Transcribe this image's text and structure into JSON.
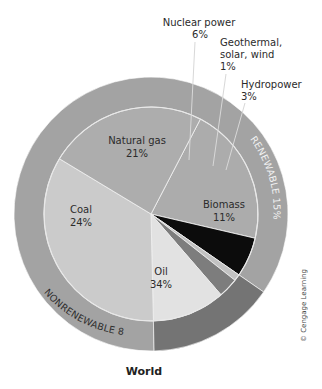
{
  "chart_data": {
    "type": "pie",
    "title": "World",
    "subtitle": "",
    "inner_ring": {
      "categories": [
        "Natural gas",
        "Nuclear power",
        "Geothermal, solar, wind",
        "Hydropower",
        "Biomass",
        "Oil",
        "Coal"
      ],
      "values": [
        21,
        6,
        1,
        3,
        11,
        34,
        24
      ],
      "unit": "%",
      "colors": [
        "#acacac",
        "#0c0c0c",
        "#c2c2c2",
        "#7d7d7d",
        "#e2e2e2",
        "#cbcbcb",
        "#adadad"
      ]
    },
    "outer_ring": {
      "categories": [
        "NONRENEWABLE",
        "RENEWABLE"
      ],
      "values": [
        85,
        15
      ],
      "unit": "%",
      "colors": [
        "#a3a3a3",
        "#747474"
      ]
    },
    "start_angle_deg_clockwise_from_top": 27.5,
    "legend": "none (direct labels)",
    "source_note": "© Cengage Learning"
  },
  "labels": {
    "natural_gas": {
      "name": "Natural gas",
      "value": "21%"
    },
    "coal": {
      "name": "Coal",
      "value": "24%"
    },
    "oil": {
      "name": "Oil",
      "value": "34%"
    },
    "biomass": {
      "name": "Biomass",
      "value": "11%"
    },
    "nuclear": {
      "name": "Nuclear power",
      "value": "6%"
    },
    "geothermal": {
      "line1": "Geothermal,",
      "line2": "solar, wind",
      "value": "1%"
    },
    "hydropower": {
      "name": "Hydropower",
      "value": "3%"
    },
    "renewable_band": "RENEWABLE 15%",
    "nonrenewable_band": "NONRENEWABLE 85%",
    "title": "World",
    "copyright": "© Cengage Learning"
  }
}
